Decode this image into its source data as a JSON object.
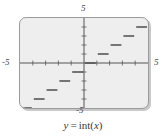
{
  "figure": {
    "caption": {
      "lhs": "y",
      "operator": "=",
      "func": "int",
      "open_paren": "(",
      "arg": "x",
      "close_paren": ")",
      "full_text": "y = int(x)"
    },
    "screen": {
      "background_color": "#eeeeee",
      "border_color": "#9a9a9a",
      "shadow_color": "#c9c9c9"
    },
    "axis_labels": {
      "top": "5",
      "left": "-5",
      "right": "5",
      "bottom": "-5"
    }
  },
  "chart_data": {
    "type": "line",
    "subtitle": "",
    "xlabel": "",
    "ylabel": "",
    "xlim": [
      -5,
      5
    ],
    "ylim": [
      -5,
      5
    ],
    "xticks": [
      -4,
      -3,
      -2,
      -1,
      1,
      2,
      3,
      4
    ],
    "yticks": [
      -4,
      -3,
      -2,
      -1,
      1,
      2,
      3,
      4
    ],
    "grid": false,
    "legend": "none",
    "axis_color": "#555555",
    "tick_color": "#777777",
    "series_color": "#4d4d4d",
    "series_width": 1.6,
    "annotations": {
      "x_axis_left_label": "-5",
      "x_axis_right_label": "5",
      "y_axis_top_label": "5",
      "y_axis_bottom_label": "-5"
    },
    "series": [
      {
        "name": "y = int(x)",
        "type": "step",
        "segments": [
          {
            "x0": -5,
            "x1": -4,
            "y": -5
          },
          {
            "x0": -4,
            "x1": -3,
            "y": -4
          },
          {
            "x0": -3,
            "x1": -2,
            "y": -3
          },
          {
            "x0": -2,
            "x1": -1,
            "y": -2
          },
          {
            "x0": -1,
            "x1": 0,
            "y": -1
          },
          {
            "x0": 0,
            "x1": 1,
            "y": 0
          },
          {
            "x0": 1,
            "x1": 2,
            "y": 1
          },
          {
            "x0": 2,
            "x1": 3,
            "y": 2
          },
          {
            "x0": 3,
            "x1": 4,
            "y": 3
          },
          {
            "x0": 4,
            "x1": 5,
            "y": 4
          }
        ]
      }
    ]
  }
}
